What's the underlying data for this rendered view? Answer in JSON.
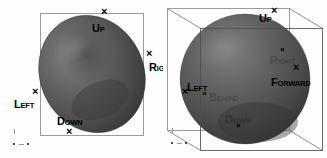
{
  "figure": {
    "background_color": "#ffffff",
    "panel_count": 2
  },
  "colors": {
    "body_fill_dark": "#3a3a3a",
    "body_fill_mid": "#565656",
    "body_fill_light": "#6e6e6e",
    "body_highlight": "#7d7d7d",
    "frame_line": "#9b9b9b",
    "wire_line": "#7d7d7d",
    "label_text": "#000000",
    "tick_color": "#9a9a9a"
  },
  "glyphs": {
    "marker": "×"
  },
  "panels": [
    {
      "id": "left",
      "name": "orthographic-2d-frame-panel",
      "frame_type": "rectangle",
      "shape": "ellipsoid",
      "labels": [
        {
          "key": "up",
          "cap": "U",
          "sc": "P",
          "text": "UP",
          "visibility": "strong"
        },
        {
          "key": "right",
          "cap": "R",
          "sc": "IGHT",
          "text": "RIGHT",
          "visibility": "strong"
        },
        {
          "key": "left",
          "cap": "L",
          "sc": "EFT",
          "text": "LEFT",
          "visibility": "strong"
        },
        {
          "key": "down",
          "cap": "D",
          "sc": "OWN",
          "text": "DOWN",
          "visibility": "strong"
        }
      ],
      "markers": [
        "up",
        "right",
        "left",
        "down"
      ]
    },
    {
      "id": "right",
      "name": "perspective-3d-cube-panel",
      "frame_type": "wireframe-cube",
      "shape": "sphere",
      "labels": [
        {
          "key": "up",
          "cap": "U",
          "sc": "P",
          "text": "UP",
          "visibility": "strong"
        },
        {
          "key": "right",
          "cap": "R",
          "sc": "IGHT",
          "text": "RIGHT",
          "visibility": "faint"
        },
        {
          "key": "forward",
          "cap": "F",
          "sc": "ORWARD",
          "text": "FORWARD",
          "visibility": "strong"
        },
        {
          "key": "left",
          "cap": "L",
          "sc": "EFT",
          "text": "LEFT",
          "visibility": "strong"
        },
        {
          "key": "behind",
          "cap": "B",
          "sc": "EHIND",
          "text": "BEHIND",
          "visibility": "faint"
        },
        {
          "key": "down",
          "cap": "D",
          "sc": "OWN",
          "text": "DOWN",
          "visibility": "faint"
        }
      ],
      "markers": [
        "up",
        "right",
        "forward",
        "left",
        "behind",
        "down"
      ]
    }
  ]
}
